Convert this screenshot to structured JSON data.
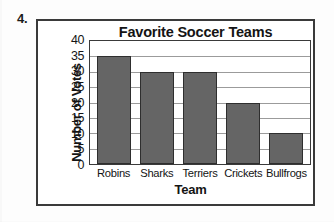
{
  "question_number": "4.",
  "chart_data": {
    "type": "bar",
    "title": "Favorite Soccer Teams",
    "xlabel": "Team",
    "ylabel": "Number of Votes",
    "categories": [
      "Robins",
      "Sharks",
      "Terriers",
      "Crickets",
      "Bullfrogs"
    ],
    "values": [
      35,
      30,
      30,
      20,
      10
    ],
    "ylim": [
      0,
      40
    ],
    "ytick_labels": [
      "40",
      "35",
      "30",
      "25",
      "20",
      "15",
      "10",
      "5",
      "0"
    ],
    "ytick_values": [
      40,
      35,
      30,
      25,
      20,
      15,
      10,
      5,
      0
    ],
    "ytick_step": 5,
    "grid": true,
    "legend": null,
    "colors": {
      "bar_fill": "#656565",
      "bar_stroke": "#2e2e2e",
      "gridline": "#9b9b9b",
      "frame": "#3a3a3a",
      "text": "#141414",
      "background": "#ffffff"
    }
  }
}
